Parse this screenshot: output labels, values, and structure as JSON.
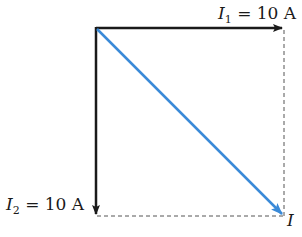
{
  "diagram": {
    "type": "phasor-vector-addition",
    "vectors": [
      {
        "id": "I1",
        "symbol": "I",
        "subscript": "1",
        "value_text": "= 10 A",
        "direction": "right",
        "color": "#1a1a1a"
      },
      {
        "id": "I2",
        "symbol": "I",
        "subscript": "2",
        "value_text": "= 10 A",
        "direction": "down",
        "color": "#1a1a1a"
      },
      {
        "id": "I",
        "symbol": "I",
        "subscript": "",
        "value_text": "",
        "direction": "diagonal-down-right",
        "color": "#3a8ad8"
      }
    ],
    "guides": {
      "style": "dashed",
      "color": "#555555"
    }
  }
}
